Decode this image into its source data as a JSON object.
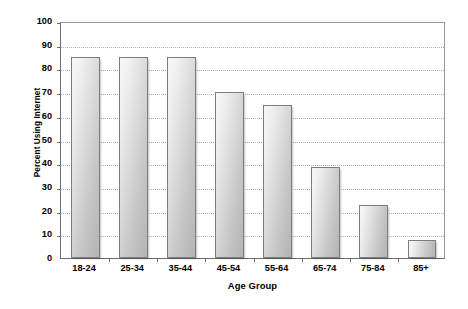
{
  "chart_data": {
    "type": "bar",
    "title": "",
    "subtitle": "",
    "xlabel": "Age Group",
    "ylabel": "Percent Using Internet",
    "categories": [
      "18-24",
      "25-34",
      "35-44",
      "45-54",
      "55-64",
      "65-74",
      "75-84",
      "85+"
    ],
    "values": [
      85,
      85,
      85,
      70,
      64.5,
      38.5,
      22.5,
      7.5
    ],
    "ylim": [
      0,
      100
    ],
    "ytick_step": 10,
    "yticks": [
      0,
      10,
      20,
      30,
      40,
      50,
      60,
      70,
      80,
      90,
      100
    ],
    "ytick_labels": [
      "0",
      "10",
      "20",
      "30",
      "40",
      "50",
      "60",
      "70",
      "80",
      "90",
      "100"
    ],
    "grid": true,
    "grid_axis": "y",
    "grid_style": "dotted",
    "legend": false,
    "legend_position": "none",
    "annotations": []
  },
  "style": {
    "bar_fill_light": "#f7f7f7",
    "bar_fill_dark": "#b4b4b4",
    "bar_border": "#7d7d7d",
    "axis_color": "#6e6e6e",
    "grid_color": "#aeaeae",
    "text_color": "#000000",
    "background": "#ffffff"
  }
}
